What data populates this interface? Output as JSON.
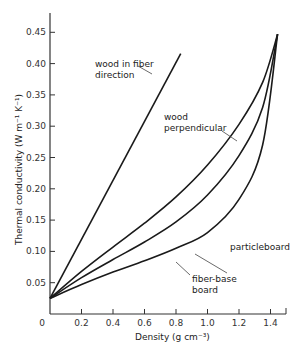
{
  "chart_data": {
    "type": "line",
    "title": "",
    "xlabel": "Density (g cm⁻³)",
    "ylabel": "Thermal conductivity (W m⁻¹ K⁻¹)",
    "xlim": [
      0,
      1.5
    ],
    "ylim": [
      0,
      0.45
    ],
    "x_ticks": [
      "0",
      "0.2",
      "0.4",
      "0.6",
      "0.8",
      "1.0",
      "1.2",
      "1.4"
    ],
    "y_ticks": [
      "0.05",
      "0.10",
      "0.15",
      "0.20",
      "0.25",
      "0.30",
      "0.35",
      "0.40",
      "0.45"
    ],
    "grid": false,
    "legend": "inline annotations",
    "series": [
      {
        "name": "wood in fiber direction",
        "x": [
          0.0,
          0.2,
          0.4,
          0.6,
          0.83
        ],
        "y": [
          0.025,
          0.119,
          0.214,
          0.309,
          0.416
        ]
      },
      {
        "name": "wood perpendicular",
        "x": [
          0.0,
          0.2,
          0.4,
          0.6,
          0.8,
          1.0,
          1.2,
          1.35,
          1.445
        ],
        "y": [
          0.025,
          0.068,
          0.107,
          0.145,
          0.187,
          0.238,
          0.303,
          0.37,
          0.447
        ]
      },
      {
        "name": "particleboard",
        "x": [
          0.0,
          0.2,
          0.4,
          0.6,
          0.8,
          1.0,
          1.2,
          1.35,
          1.445
        ],
        "y": [
          0.025,
          0.058,
          0.087,
          0.115,
          0.147,
          0.19,
          0.253,
          0.33,
          0.447
        ]
      },
      {
        "name": "fiber-base board",
        "x": [
          0.0,
          0.2,
          0.4,
          0.6,
          0.8,
          1.0,
          1.2,
          1.35,
          1.445
        ],
        "y": [
          0.025,
          0.047,
          0.067,
          0.085,
          0.105,
          0.13,
          0.183,
          0.27,
          0.447
        ]
      }
    ],
    "annotations": [
      "wood in fiber direction",
      "wood perpendicular",
      "particleboard",
      "fiber-base board"
    ]
  },
  "labels": {
    "fiber_line1": "wood in fiber",
    "fiber_line2": "direction",
    "perp_line1": "wood",
    "perp_line2": "perpendicular",
    "particle": "particleboard",
    "fbb_line1": "fiber-base",
    "fbb_line2": "board",
    "ylabel": "Thermal conductivity (W m⁻¹ K⁻¹)",
    "xlabel": "Density (g cm⁻³)",
    "origin": "0"
  }
}
